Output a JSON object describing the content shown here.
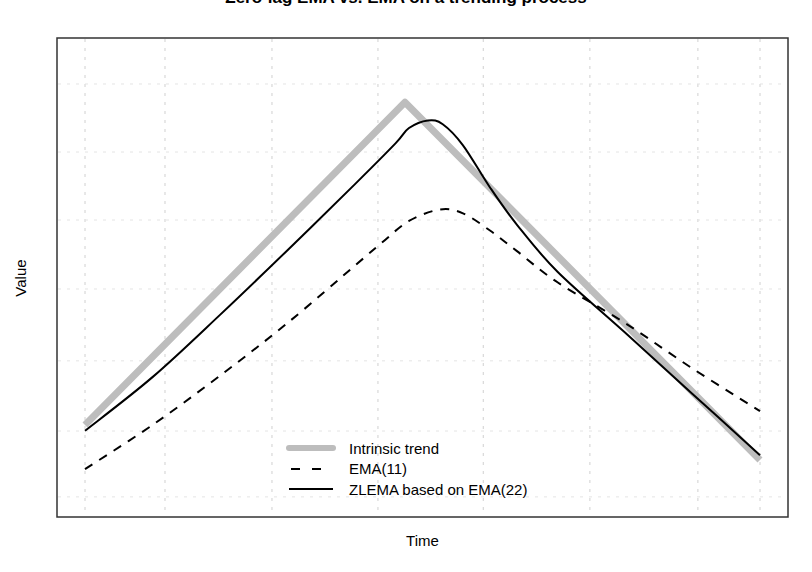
{
  "chart_data": {
    "type": "line",
    "title": "Zero-lag EMA vs. EMA on a trending process",
    "title_visible": "clipped at top of image (only descenders visible)",
    "xlabel": "Time",
    "ylabel": "Value",
    "x_ticks": [],
    "y_ticks": [],
    "grid": true,
    "grid_style": "dotted light grey",
    "xlim": [
      -4.2,
      104.1
    ],
    "ylim": [
      0,
      100
    ],
    "legend_position": "bottom center (inside plot)",
    "legend": [
      "Intrinsic trend",
      "EMA(11)",
      "ZLEMA based on EMA(22)"
    ],
    "series": [
      {
        "name": "Intrinsic trend",
        "style": "solid thick",
        "color": "#bdbdbd",
        "width": 7,
        "x": [
          0,
          47.4,
          100
        ],
        "values": [
          19.2,
          86.6,
          11.9
        ]
      },
      {
        "name": "EMA(11)",
        "style": "dashed",
        "color": "#000000",
        "width": 2,
        "x": [
          0,
          10,
          20,
          30,
          40,
          44,
          48,
          52.6,
          56,
          60,
          64,
          70,
          80,
          90,
          100
        ],
        "values": [
          10,
          19.2,
          29.5,
          40.5,
          52.5,
          57.3,
          61.8,
          64.2,
          63.4,
          59.8,
          55.5,
          49.0,
          40.5,
          31.0,
          22.1
        ]
      },
      {
        "name": "ZLEMA based on EMA(22)",
        "style": "solid",
        "color": "#000000",
        "width": 2,
        "x": [
          0,
          10,
          20,
          30,
          40,
          46,
          48,
          50.8,
          53,
          56,
          60,
          64,
          70,
          80,
          90,
          100
        ],
        "values": [
          18,
          29.2,
          42.2,
          55.7,
          69.5,
          78.0,
          81.2,
          82.8,
          82.0,
          77.6,
          68.8,
          61.0,
          51.2,
          38.5,
          25.7,
          12.9
        ]
      }
    ],
    "gridlines_x": [
      0,
      11.85,
      27.7,
      43.4,
      59.0,
      74.8,
      90.8,
      100
    ],
    "gridlines_y": [
      4.2,
      17.95,
      32.6,
      47.6,
      62.0,
      76.2,
      90.4
    ]
  },
  "labels": {
    "title": "Zero-lag EMA vs. EMA on a trending process",
    "xlabel": "Time",
    "ylabel": "Value"
  },
  "legend": {
    "items": [
      {
        "label": "Intrinsic trend",
        "key": "thick-grey"
      },
      {
        "label": "EMA(11)",
        "key": "dashed-black"
      },
      {
        "label": "ZLEMA based on EMA(22)",
        "key": "solid-black"
      }
    ]
  }
}
